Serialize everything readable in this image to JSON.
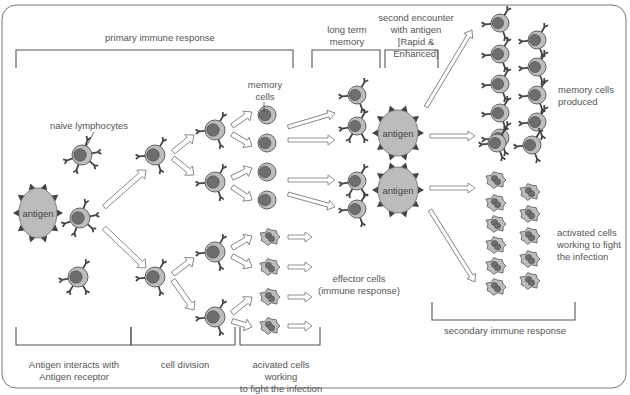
{
  "colors": {
    "frame": "#777777",
    "bracket": "#555555",
    "text": "#555555",
    "cell_fill": "#bdbdbd",
    "cell_stroke": "#555555",
    "nucleus": "#6e6e6e",
    "receptor": "#444444",
    "antigen_fill": "#bcbcbc",
    "spike": "#444444",
    "arrow_fill": "#ffffff",
    "arrow_stroke": "#777777"
  },
  "labels": {
    "primary": "primary immune response",
    "long_term": "long term\nmemory",
    "second_encounter": "second encounter\nwith antigen\n[Rapid & Enhanced]",
    "naive": "naive lymphocytes",
    "memory_cells": "memory\ncells",
    "memory_produced": "memory cells\nproduced",
    "activated_right": "activated cells\nworking to fight\nthe infection",
    "effector": "effector cells\n(immune response)",
    "secondary": "secondary immune response",
    "antigen_interacts": "Antigen interacts with\nAntigen receptor",
    "cell_division": "cell division",
    "acivated_bottom": "acivated cells working\nto fight the infection",
    "antigen": "antigen"
  },
  "antigens": [
    {
      "x": 38,
      "y": 213,
      "rx": 19,
      "ry": 25
    },
    {
      "x": 398,
      "y": 133,
      "rx": 20,
      "ry": 23
    },
    {
      "x": 398,
      "y": 190,
      "rx": 20,
      "ry": 23
    }
  ],
  "lymphocytes": [
    {
      "x": 82,
      "y": 155,
      "r": 10,
      "rec": 5
    },
    {
      "x": 80,
      "y": 218,
      "r": 10,
      "rec": 5
    },
    {
      "x": 78,
      "y": 277,
      "r": 10,
      "rec": 4
    },
    {
      "x": 155,
      "y": 155,
      "r": 10,
      "rec": 3
    },
    {
      "x": 155,
      "y": 277,
      "r": 10,
      "rec": 3
    },
    {
      "x": 215,
      "y": 130,
      "r": 10,
      "rec": 3
    },
    {
      "x": 215,
      "y": 182,
      "r": 10,
      "rec": 3
    },
    {
      "x": 215,
      "y": 252,
      "r": 10,
      "rec": 3
    },
    {
      "x": 215,
      "y": 317,
      "r": 10,
      "rec": 3
    },
    {
      "x": 357,
      "y": 95,
      "r": 9,
      "rec": 3
    },
    {
      "x": 357,
      "y": 126,
      "r": 9,
      "rec": 4
    },
    {
      "x": 357,
      "y": 181,
      "r": 9,
      "rec": 4
    },
    {
      "x": 357,
      "y": 209,
      "r": 9,
      "rec": 3
    },
    {
      "x": 500,
      "y": 23,
      "r": 9,
      "rec": 3
    },
    {
      "x": 500,
      "y": 54,
      "r": 9,
      "rec": 3
    },
    {
      "x": 500,
      "y": 84,
      "r": 9,
      "rec": 3
    },
    {
      "x": 500,
      "y": 113,
      "r": 9,
      "rec": 3
    },
    {
      "x": 500,
      "y": 138,
      "r": 9,
      "rec": 3
    },
    {
      "x": 537,
      "y": 40,
      "r": 9,
      "rec": 3
    },
    {
      "x": 537,
      "y": 67,
      "r": 9,
      "rec": 3
    },
    {
      "x": 537,
      "y": 95,
      "r": 9,
      "rec": 3
    },
    {
      "x": 537,
      "y": 122,
      "r": 9,
      "rec": 3
    },
    {
      "x": 497,
      "y": 143,
      "r": 9,
      "rec": 3
    },
    {
      "x": 532,
      "y": 145,
      "r": 9,
      "rec": 3
    }
  ],
  "memory_cells": [
    {
      "x": 267,
      "y": 115
    },
    {
      "x": 267,
      "y": 143
    },
    {
      "x": 267,
      "y": 172
    },
    {
      "x": 267,
      "y": 200
    }
  ],
  "effector_cells": [
    {
      "x": 270,
      "y": 237
    },
    {
      "x": 270,
      "y": 267
    },
    {
      "x": 270,
      "y": 297
    },
    {
      "x": 270,
      "y": 326
    },
    {
      "x": 496,
      "y": 180
    },
    {
      "x": 496,
      "y": 203
    },
    {
      "x": 496,
      "y": 224
    },
    {
      "x": 496,
      "y": 245
    },
    {
      "x": 496,
      "y": 266
    },
    {
      "x": 496,
      "y": 287
    },
    {
      "x": 530,
      "y": 192
    },
    {
      "x": 530,
      "y": 214
    },
    {
      "x": 530,
      "y": 236
    },
    {
      "x": 530,
      "y": 259
    },
    {
      "x": 530,
      "y": 281
    }
  ],
  "arrows": [
    {
      "x1": 104,
      "y1": 207,
      "x2": 146,
      "y2": 170,
      "w": 5
    },
    {
      "x1": 104,
      "y1": 228,
      "x2": 146,
      "y2": 268,
      "w": 5
    },
    {
      "x1": 173,
      "y1": 152,
      "x2": 194,
      "y2": 135,
      "w": 5
    },
    {
      "x1": 173,
      "y1": 158,
      "x2": 194,
      "y2": 175,
      "w": 5
    },
    {
      "x1": 173,
      "y1": 274,
      "x2": 194,
      "y2": 258,
      "w": 5
    },
    {
      "x1": 173,
      "y1": 280,
      "x2": 194,
      "y2": 310,
      "w": 5
    },
    {
      "x1": 232,
      "y1": 126,
      "x2": 252,
      "y2": 112,
      "w": 5
    },
    {
      "x1": 232,
      "y1": 134,
      "x2": 252,
      "y2": 146,
      "w": 5
    },
    {
      "x1": 232,
      "y1": 178,
      "x2": 252,
      "y2": 168,
      "w": 5
    },
    {
      "x1": 232,
      "y1": 187,
      "x2": 252,
      "y2": 200,
      "w": 5
    },
    {
      "x1": 232,
      "y1": 248,
      "x2": 252,
      "y2": 236,
      "w": 5
    },
    {
      "x1": 232,
      "y1": 256,
      "x2": 252,
      "y2": 267,
      "w": 5
    },
    {
      "x1": 232,
      "y1": 313,
      "x2": 252,
      "y2": 297,
      "w": 5
    },
    {
      "x1": 232,
      "y1": 321,
      "x2": 252,
      "y2": 327,
      "w": 5
    },
    {
      "x1": 288,
      "y1": 127,
      "x2": 335,
      "y2": 113,
      "w": 4
    },
    {
      "x1": 288,
      "y1": 140,
      "x2": 335,
      "y2": 140,
      "w": 4
    },
    {
      "x1": 288,
      "y1": 180,
      "x2": 335,
      "y2": 180,
      "w": 4
    },
    {
      "x1": 288,
      "y1": 194,
      "x2": 335,
      "y2": 207,
      "w": 4
    },
    {
      "x1": 288,
      "y1": 237,
      "x2": 312,
      "y2": 237,
      "w": 4
    },
    {
      "x1": 288,
      "y1": 267,
      "x2": 312,
      "y2": 267,
      "w": 4
    },
    {
      "x1": 288,
      "y1": 297,
      "x2": 312,
      "y2": 297,
      "w": 4
    },
    {
      "x1": 288,
      "y1": 326,
      "x2": 312,
      "y2": 326,
      "w": 4
    },
    {
      "x1": 426,
      "y1": 107,
      "x2": 472,
      "y2": 30,
      "w": 4
    },
    {
      "x1": 430,
      "y1": 136,
      "x2": 475,
      "y2": 136,
      "w": 4
    },
    {
      "x1": 430,
      "y1": 188,
      "x2": 475,
      "y2": 188,
      "w": 4
    },
    {
      "x1": 430,
      "y1": 210,
      "x2": 475,
      "y2": 282,
      "w": 4
    }
  ],
  "brackets": [
    {
      "x1": 16,
      "x2": 293,
      "y": 50,
      "dir": "down",
      "h": 18
    },
    {
      "x1": 312,
      "x2": 380,
      "y": 50,
      "dir": "down",
      "h": 18
    },
    {
      "x1": 385,
      "x2": 438,
      "y": 50,
      "dir": "down",
      "h": 18
    },
    {
      "x1": 16,
      "x2": 131,
      "y": 345,
      "dir": "up",
      "h": 18
    },
    {
      "x1": 131,
      "x2": 235,
      "y": 345,
      "dir": "up",
      "h": 18
    },
    {
      "x1": 240,
      "x2": 320,
      "y": 345,
      "dir": "up",
      "h": 18
    },
    {
      "x1": 432,
      "x2": 575,
      "y": 320,
      "dir": "up",
      "h": 18
    }
  ]
}
